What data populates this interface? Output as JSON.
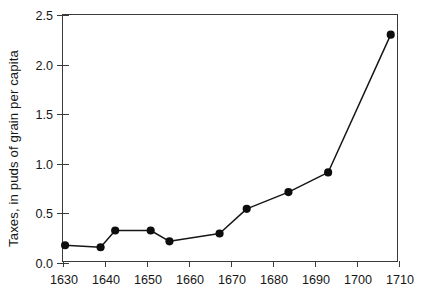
{
  "chart_data": {
    "type": "line",
    "title": "",
    "xlabel": "",
    "ylabel": "Taxes, in puds of grain per capita",
    "xlim": [
      1630,
      1710
    ],
    "ylim": [
      0.0,
      2.5
    ],
    "xticks": [
      1630,
      1640,
      1650,
      1660,
      1670,
      1680,
      1690,
      1700,
      1710
    ],
    "xtick_labels": [
      "1630",
      "1640",
      "1650",
      "1660",
      "1670",
      "1680",
      "1690",
      "1700",
      "1710"
    ],
    "yticks": [
      0.0,
      0.5,
      1.0,
      1.5,
      2.0,
      2.5
    ],
    "ytick_labels": [
      "0.0",
      "0.5",
      "1.0",
      "1.5",
      "2.0",
      "2.5"
    ],
    "grid": false,
    "legend": null,
    "series": [
      {
        "name": "Taxes per capita",
        "marker": "filled-circle",
        "color": "#0d0d0d",
        "x": [
          1630.5,
          1639.0,
          1642.5,
          1651.0,
          1655.5,
          1667.5,
          1674.0,
          1684.0,
          1693.5,
          1708.5
        ],
        "y": [
          0.16,
          0.14,
          0.31,
          0.31,
          0.2,
          0.28,
          0.53,
          0.7,
          0.9,
          2.3
        ]
      }
    ]
  },
  "figure": {
    "background_color": "#ffffff",
    "axis_color": "#3a3a3a",
    "text_color": "#161616"
  }
}
